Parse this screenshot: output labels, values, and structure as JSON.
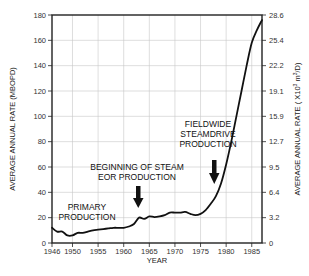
{
  "chart_data": {
    "type": "line",
    "title": "",
    "xlabel": "YEAR",
    "ylabel": "AVERAGE ANNUAL RATE (MBOPD)",
    "y2label": "AVERAGE ANNUAL RATE (X10³ m³/D)",
    "xlim": [
      1946,
      1987
    ],
    "ylim": [
      0,
      180
    ],
    "grid": true,
    "x_ticks": [
      1946,
      1950,
      1955,
      1960,
      1965,
      1970,
      1975,
      1980,
      1985
    ],
    "y_ticks": [
      0,
      20,
      40,
      60,
      80,
      100,
      120,
      140,
      160,
      180
    ],
    "y2_ticks": [
      "0",
      "3.2",
      "6.4",
      "9.5",
      "12.7",
      "15.9",
      "19.1",
      "22.2",
      "25.4",
      "28.6"
    ],
    "series": [
      {
        "name": "Average annual rate",
        "x": [
          1946,
          1947,
          1948,
          1949,
          1950,
          1951,
          1952,
          1953,
          1954,
          1955,
          1956,
          1957,
          1958,
          1959,
          1960,
          1961,
          1962,
          1963,
          1964,
          1965,
          1966,
          1967,
          1968,
          1969,
          1970,
          1971,
          1972,
          1973,
          1974,
          1975,
          1976,
          1977,
          1978,
          1979,
          1980,
          1981,
          1982,
          1983,
          1984,
          1985,
          1986,
          1987
        ],
        "values": [
          12,
          9,
          9,
          6,
          6,
          8,
          8,
          9,
          10,
          10.5,
          11,
          11.5,
          12,
          12,
          12,
          13,
          15,
          20,
          19,
          21,
          20.5,
          21,
          22,
          24,
          24,
          24,
          24.5,
          23,
          22,
          23,
          26,
          31,
          37,
          47,
          62,
          80,
          100,
          120,
          140,
          158,
          168,
          176
        ]
      }
    ],
    "annotations": [
      {
        "text": [
          "PRIMARY",
          "PRODUCTION"
        ],
        "x": 1949,
        "y": 13
      },
      {
        "text": [
          "BEGINNING OF STEAM",
          "EOR PRODUCTION"
        ],
        "arrow_x": 1963,
        "arrow_y": 20
      },
      {
        "text": [
          "FIELDWIDE",
          "STEAMDRIVE",
          "PRODUCTION"
        ],
        "arrow_x": 1978,
        "arrow_y": 37
      }
    ]
  },
  "labels": {
    "xlabel": "YEAR",
    "ylabel": "AVERAGE ANNUAL RATE (MBOPD)",
    "y2label_main": "AVERAGE ANNUAL RATE ( X10",
    "y2label_sup": "3",
    "y2label_mid": " m",
    "y2label_sup2": "3",
    "y2label_end": "/D)",
    "primary_1": "PRIMARY",
    "primary_2": "PRODUCTION",
    "steam_1": "BEGINNING OF STEAM",
    "steam_2": "EOR PRODUCTION",
    "field_1": "FIELDWIDE",
    "field_2": "STEAMDRIVE",
    "field_3": "PRODUCTION"
  },
  "colors": {
    "line": "#111111",
    "grid": "#c8c8c8",
    "axis": "#222222",
    "text": "#222222"
  }
}
